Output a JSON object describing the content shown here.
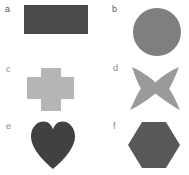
{
  "figure": {
    "background_color": "#ffffff",
    "width": 189,
    "height": 175,
    "layout": "2-column by 3-row grid of labeled shape panels"
  },
  "panels": [
    {
      "label": "a",
      "shape_name": "rectangle",
      "color": "#4a4a4a",
      "label_color": "#555555"
    },
    {
      "label": "b",
      "shape_name": "circle",
      "color": "#7f7f7f",
      "label_color": "#555555"
    },
    {
      "label": "c",
      "shape_name": "cross",
      "color": "#b6b6b6",
      "label_color": "#8a8a8a"
    },
    {
      "label": "d",
      "shape_name": "four-pointed-star",
      "color": "#9a9a9a",
      "label_color": "#8a8a8a"
    },
    {
      "label": "e",
      "shape_name": "heart",
      "color": "#414141",
      "label_color": "#8a8a8a"
    },
    {
      "label": "f",
      "shape_name": "hexagon",
      "color": "#585858",
      "label_color": "#8a8a8a"
    }
  ]
}
